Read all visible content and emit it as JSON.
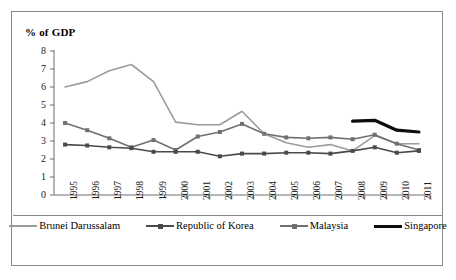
{
  "figure": {
    "title": "% of GDP"
  },
  "chart_data": {
    "type": "line",
    "title": "% of GDP",
    "xlabel": "",
    "ylabel": "% of GDP",
    "ylim": [
      0,
      8
    ],
    "yticks": [
      0,
      1,
      2,
      3,
      4,
      5,
      6,
      7,
      8
    ],
    "grid": false,
    "legend_position": "bottom",
    "categories": [
      "1995",
      "1996",
      "1997",
      "1998",
      "1999",
      "2000",
      "2001",
      "2002",
      "2003",
      "2004",
      "2005",
      "2006",
      "2007",
      "2008",
      "2009",
      "2010",
      "2011"
    ],
    "series": [
      {
        "name": "Brunei Darussalam",
        "color": "#9c9c9c",
        "marker": "none",
        "line_width": 1.6,
        "values": [
          6.0,
          6.3,
          6.9,
          7.25,
          6.3,
          4.05,
          3.9,
          3.9,
          4.65,
          3.4,
          2.9,
          2.65,
          2.8,
          2.45,
          3.3,
          2.85,
          2.85
        ]
      },
      {
        "name": "Republic of Korea",
        "color": "#4a4a4a",
        "marker": "square",
        "line_width": 1.6,
        "values": [
          2.8,
          2.75,
          2.65,
          2.6,
          2.4,
          2.4,
          2.4,
          2.15,
          2.3,
          2.3,
          2.35,
          2.35,
          2.3,
          2.45,
          2.65,
          2.35,
          2.45
        ]
      },
      {
        "name": "Malaysia",
        "color": "#707070",
        "marker": "square",
        "line_width": 1.6,
        "values": [
          4.0,
          3.6,
          3.15,
          2.65,
          3.05,
          2.5,
          3.25,
          3.5,
          3.95,
          3.4,
          3.2,
          3.15,
          3.2,
          3.1,
          3.35,
          2.85,
          2.5
        ]
      },
      {
        "name": "Singapore",
        "color": "#0d0d0d",
        "marker": "none",
        "line_width": 3.2,
        "values": [
          null,
          null,
          null,
          null,
          null,
          null,
          null,
          null,
          null,
          null,
          null,
          null,
          null,
          4.1,
          4.15,
          3.6,
          3.5
        ]
      }
    ]
  },
  "legend": {
    "items": [
      {
        "label": "Brunei Darussalam",
        "color": "#9c9c9c",
        "marker": false,
        "thick": false
      },
      {
        "label": "Republic of Korea",
        "color": "#4a4a4a",
        "marker": true,
        "thick": false
      },
      {
        "label": "Malaysia",
        "color": "#707070",
        "marker": true,
        "thick": false
      },
      {
        "label": "Singapore",
        "color": "#0d0d0d",
        "marker": false,
        "thick": true
      }
    ]
  }
}
